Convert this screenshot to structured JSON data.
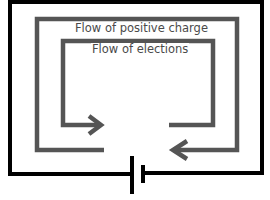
{
  "diagram": {
    "labels": {
      "positive_charge": "Flow of positive charge",
      "electrons": "Flow of elections"
    },
    "colors": {
      "wire": "#000000",
      "flow_arrow": "#555555",
      "background": "#ffffff"
    },
    "components": [
      {
        "type": "wire",
        "name": "circuit-loop"
      },
      {
        "type": "battery",
        "name": "battery-cell"
      },
      {
        "type": "arrow",
        "name": "positive-charge-flow",
        "direction": "clockwise"
      },
      {
        "type": "arrow",
        "name": "electron-flow",
        "direction": "counterclockwise"
      }
    ]
  }
}
